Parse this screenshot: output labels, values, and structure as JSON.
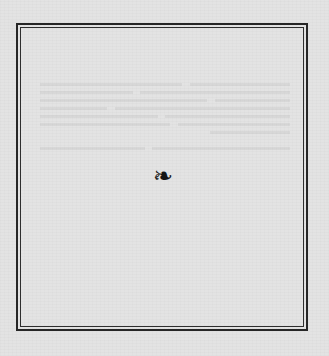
{
  "page": {
    "background_color": "#e3e3e3",
    "frame_color": "#262626",
    "frame_style": "double-rule border"
  },
  "ornament": {
    "icon": "fleuron-icon",
    "glyph": "❧",
    "color": "#151515"
  },
  "bleed_through": {
    "note": "illegible show-through text from reverse page",
    "lines": [
      "                                               ",
      "                                               ",
      "                                               ",
      "                                               ",
      "                                               ",
      "                                               ",
      "                                               ",
      "                                               "
    ]
  }
}
